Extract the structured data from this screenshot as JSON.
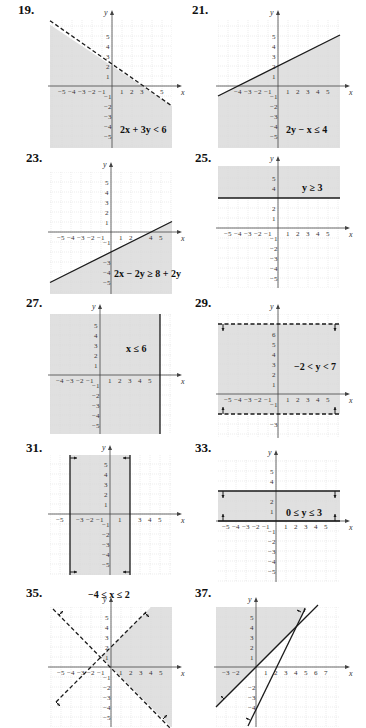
{
  "page": {
    "background": "#ffffff",
    "grid_color": "#d8d8d8",
    "shade_color": "#e0e0e0",
    "line_color": "#1a1a1a"
  },
  "chart_data": [
    {
      "id": "19",
      "label": "19.",
      "type": "area",
      "title": "2x + 3y < 6",
      "inequality": "2x + 3y < 6",
      "boundary": "y = -2/3 x + 2",
      "line_style": "dashed",
      "shade": "below",
      "xlim": [
        -6,
        6
      ],
      "ylim": [
        -6,
        6
      ],
      "x_ticks": [
        "-5",
        "-4",
        "-3",
        "-2",
        "-1",
        "1",
        "2",
        "3",
        "5"
      ],
      "y_ticks": [
        "5",
        "4",
        "3",
        "2",
        "1",
        "-1",
        "-2",
        "-3",
        "-4",
        "-5"
      ],
      "xlabel": "x",
      "ylabel": "y",
      "grid": true
    },
    {
      "id": "21",
      "label": "21.",
      "type": "area",
      "title": "2y − x ≤ 4",
      "inequality": "2y − x ≤ 4",
      "boundary": "y = 1/2 x + 2",
      "line_style": "solid",
      "shade": "below",
      "xlim": [
        -6,
        6
      ],
      "ylim": [
        -6,
        6
      ],
      "x_ticks": [
        "-4",
        "-3",
        "-2",
        "-1",
        "1",
        "2",
        "3",
        "4",
        "5"
      ],
      "y_ticks": [
        "5",
        "4",
        "3",
        "2",
        "1",
        "-1",
        "-2",
        "-3",
        "-4",
        "-5"
      ],
      "xlabel": "x",
      "ylabel": "y",
      "grid": true
    },
    {
      "id": "23",
      "label": "23.",
      "type": "area",
      "title": "2x − 2y ≥ 8 + 2y",
      "inequality": "2x − 2y ≥ 8 + 2y",
      "boundary": "y = 1/2 x − 2",
      "line_style": "solid",
      "shade": "below",
      "xlim": [
        -6,
        6
      ],
      "ylim": [
        -6,
        6
      ],
      "x_ticks": [
        "-5",
        "-4",
        "-3",
        "-2",
        "-1",
        "1",
        "2",
        "4",
        "5"
      ],
      "y_ticks": [
        "5",
        "4",
        "3",
        "2",
        "1",
        "-1",
        "-3",
        "-4",
        "-5"
      ],
      "xlabel": "x",
      "ylabel": "y",
      "grid": true
    },
    {
      "id": "25",
      "label": "25.",
      "type": "area",
      "title": "y ≥ 3",
      "inequality": "y ≥ 3",
      "boundary": "y = 3",
      "line_style": "solid",
      "shade": "above",
      "xlim": [
        -6,
        6
      ],
      "ylim": [
        -6,
        6
      ],
      "x_ticks": [
        "-5",
        "-4",
        "-3",
        "-2",
        "-1",
        "1",
        "2",
        "3",
        "4",
        "5"
      ],
      "y_ticks": [
        "5",
        "4",
        "2",
        "1",
        "-1",
        "-2",
        "-3",
        "-4",
        "-5"
      ],
      "xlabel": "x",
      "ylabel": "y",
      "grid": true
    },
    {
      "id": "27",
      "label": "27.",
      "type": "area",
      "title": "x ≤ 6",
      "inequality": "x ≤ 6",
      "boundary": "x = 6",
      "line_style": "solid",
      "shade": "left",
      "xlim": [
        -5,
        7
      ],
      "ylim": [
        -6,
        6
      ],
      "x_ticks": [
        "-4",
        "-3",
        "-2",
        "-1",
        "1",
        "2",
        "3",
        "4",
        "5"
      ],
      "y_ticks": [
        "5",
        "4",
        "3",
        "2",
        "1",
        "-1",
        "-2",
        "-3",
        "-4",
        "-5"
      ],
      "xlabel": "x",
      "ylabel": "y",
      "grid": true
    },
    {
      "id": "29",
      "label": "29.",
      "type": "area",
      "title": "−2 < y < 7",
      "inequality": "−2 < y < 7",
      "boundary": "y = -2, y = 7",
      "line_style": "dashed",
      "shade": "between",
      "xlim": [
        -6,
        6
      ],
      "ylim": [
        -4,
        7.5
      ],
      "x_ticks": [
        "-5",
        "-4",
        "-3",
        "-2",
        "-1",
        "1",
        "2",
        "3",
        "4",
        "5"
      ],
      "y_ticks": [
        "6",
        "5",
        "4",
        "3",
        "2",
        "1",
        "-1",
        "-3"
      ],
      "xlabel": "x",
      "ylabel": "y",
      "grid": true
    },
    {
      "id": "31",
      "label": "31.",
      "type": "area",
      "title": "−4 ≤ x ≤ 2",
      "inequality": "−4 ≤ x ≤ 2",
      "boundary": "x = -4, x = 2",
      "line_style": "solid",
      "shade": "between",
      "xlim": [
        -6,
        6
      ],
      "ylim": [
        -6,
        6
      ],
      "x_ticks": [
        "-5",
        "-3",
        "-2",
        "-1",
        "1",
        "3",
        "4",
        "5"
      ],
      "y_ticks": [
        "5",
        "4",
        "3",
        "2",
        "1",
        "-1",
        "-2",
        "-3",
        "-4",
        "-5"
      ],
      "xlabel": "x",
      "ylabel": "y",
      "grid": true
    },
    {
      "id": "33",
      "label": "33.",
      "type": "area",
      "title": "0 ≤ y ≤ 3",
      "inequality": "0 ≤ y ≤ 3",
      "boundary": "y = 0, y = 3",
      "line_style": "solid",
      "shade": "between",
      "xlim": [
        -6,
        6
      ],
      "ylim": [
        -6,
        6
      ],
      "x_ticks": [
        "-5",
        "-4",
        "-3",
        "-2",
        "-1",
        "1",
        "2",
        "3",
        "4",
        "5"
      ],
      "y_ticks": [
        "5",
        "4",
        "2",
        "1",
        "-1",
        "-2",
        "-3",
        "-4",
        "-5"
      ],
      "xlabel": "x",
      "ylabel": "y",
      "grid": true
    },
    {
      "id": "35",
      "label": "35.",
      "type": "area",
      "title": "",
      "inequality": "y < x + 2 and y > −x",
      "boundary": "y = x + 2, y = -x",
      "line_style": "dashed",
      "shade": "right-wedge",
      "xlim": [
        -6,
        6
      ],
      "ylim": [
        -6,
        6
      ],
      "x_ticks": [
        "-5",
        "-4",
        "-3",
        "-2",
        "-1",
        "1",
        "2",
        "3",
        "4",
        "5"
      ],
      "y_ticks": [
        "5",
        "4",
        "3",
        "2",
        "1",
        "-1",
        "-2",
        "-3",
        "-4",
        "-5"
      ],
      "xlabel": "x",
      "ylabel": "y",
      "grid": true
    },
    {
      "id": "37",
      "label": "37.",
      "type": "area",
      "title": "",
      "inequality": "y ≥ x and y ≥ 2x − 4",
      "boundary": "y = x, y = 2x - 4",
      "line_style": "solid",
      "shade": "upper-left-wedge",
      "xlim": [
        -4,
        8
      ],
      "ylim": [
        -6,
        6
      ],
      "x_ticks": [
        "-3",
        "-2",
        "1",
        "2",
        "3",
        "4",
        "5",
        "6",
        "7"
      ],
      "y_ticks": [
        "5",
        "4",
        "3",
        "2",
        "1",
        "-2",
        "-3",
        "-4"
      ],
      "xlabel": "x",
      "ylabel": "y",
      "grid": true
    }
  ]
}
